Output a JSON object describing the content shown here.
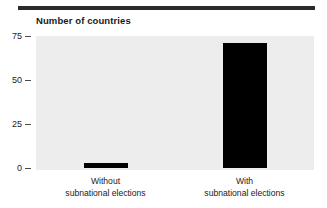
{
  "figure": {
    "title": "Number of countries",
    "background_color": "#ffffff",
    "plot_background_color": "#ededed",
    "rule_color": "#2b2b2b",
    "bar_color": "#000000"
  },
  "chart_data": {
    "type": "bar",
    "title": "Number of countries",
    "subtitle": "",
    "xlabel": "",
    "ylabel": "Number of countries",
    "categories": [
      "Without subnational elections",
      "With subnational elections"
    ],
    "category_lines": [
      {
        "line1": "Without",
        "line2": "subnational elections"
      },
      {
        "line1": "With",
        "line2": "subnational elections"
      }
    ],
    "values": [
      3,
      71
    ],
    "ylim": [
      0,
      75
    ],
    "yticks": [
      0,
      25,
      50,
      75
    ],
    "ytick_labels": [
      "0",
      "25",
      "50",
      "75"
    ],
    "grid": false,
    "legend": null,
    "legend_position": "none",
    "annotations": []
  }
}
